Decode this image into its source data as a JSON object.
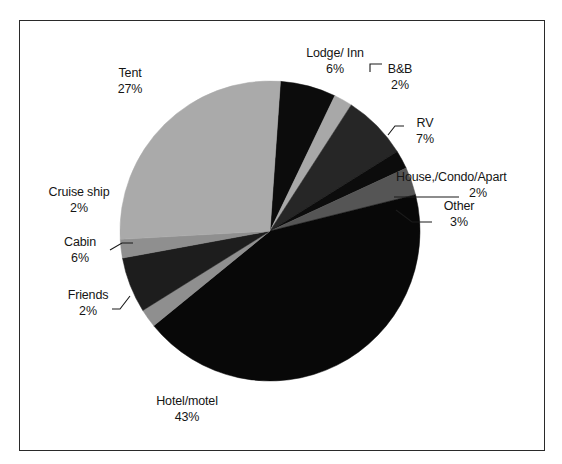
{
  "chart_data": {
    "type": "pie",
    "title": "",
    "subtitle": "",
    "xlabel": "",
    "ylabel": "",
    "legend_position": "none",
    "grid": false,
    "unit": "%",
    "start_angle_deg": 4,
    "direction": "clockwise",
    "categories": [
      "Lodge/ Inn",
      "B&B",
      "RV",
      "House,/Condo/Apart",
      "Other",
      "Hotel/motel",
      "Friends",
      "Cabin",
      "Cruise ship",
      "Tent"
    ],
    "values": [
      6,
      2,
      7,
      2,
      3,
      43,
      2,
      6,
      2,
      27
    ],
    "slices": [
      {
        "label": "Lodge/ Inn",
        "value": 6,
        "value_text": "6%",
        "color": "#0c0c0c"
      },
      {
        "label": "B&B",
        "value": 2,
        "value_text": "2%",
        "color": "#a8a8a8"
      },
      {
        "label": "RV",
        "value": 7,
        "value_text": "7%",
        "color": "#262626"
      },
      {
        "label": "House,/Condo/Apart",
        "value": 2,
        "value_text": "2%",
        "color": "#0c0c0c"
      },
      {
        "label": "Other",
        "value": 3,
        "value_text": "3%",
        "color": "#555555"
      },
      {
        "label": "Hotel/motel",
        "value": 43,
        "value_text": "43%",
        "color": "#080808"
      },
      {
        "label": "Friends",
        "value": 2,
        "value_text": "2%",
        "color": "#8f8f8f"
      },
      {
        "label": "Cabin",
        "value": 6,
        "value_text": "6%",
        "color": "#1d1d1d"
      },
      {
        "label": "Cruise ship",
        "value": 2,
        "value_text": "2%",
        "color": "#8f8f8f"
      },
      {
        "label": "Tent",
        "value": 27,
        "value_text": "27%",
        "color": "#aaaaaa"
      }
    ]
  },
  "labels": {
    "tent": {
      "name": "Tent",
      "value": "27%"
    },
    "lodge": {
      "name": "Lodge/ Inn",
      "value": "6%"
    },
    "bb": {
      "name": "B&B",
      "value": "2%"
    },
    "rv": {
      "name": "RV",
      "value": "7%"
    },
    "house": {
      "name": "House,/Condo/Apart",
      "value": "2%"
    },
    "other": {
      "name": "Other",
      "value": "3%"
    },
    "cruise": {
      "name": "Cruise ship",
      "value": "2%"
    },
    "cabin": {
      "name": "Cabin",
      "value": "6%"
    },
    "friends": {
      "name": "Friends",
      "value": "2%"
    },
    "hotel": {
      "name": "Hotel/motel",
      "value": "43%"
    }
  },
  "style": {
    "frame_color": "#2a2a2a",
    "background": "#ffffff",
    "text_color": "#151515",
    "leader_color": "#1a1a1a"
  }
}
